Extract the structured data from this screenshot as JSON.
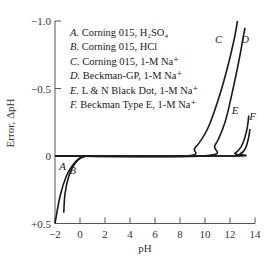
{
  "chart_data": {
    "type": "line",
    "title": "",
    "xlabel": "pH",
    "ylabel": "Error, ΔpH",
    "xlim": [
      -2,
      14
    ],
    "ylim": [
      0.5,
      -1.0
    ],
    "y_inverted": true,
    "grid": false,
    "x_ticks": [
      "-2",
      "0",
      "2",
      "4",
      "6",
      "8",
      "10",
      "12",
      "14"
    ],
    "y_ticks": [
      {
        "value": -1.0,
        "label": "−1.0"
      },
      {
        "value": -0.5,
        "label": "−0.5"
      },
      {
        "value": 0,
        "label": "0"
      },
      {
        "value": 0.5,
        "label": "+0.5"
      }
    ],
    "legend_position": "upper-left",
    "series": [
      {
        "key": "A",
        "name": "Corning 015, H₂SO₄",
        "x": [
          -2.0,
          -1.6,
          -1.1,
          -0.6,
          -0.1,
          0.3,
          0.6,
          1.0
        ],
        "y": [
          0.5,
          0.3,
          0.15,
          0.07,
          0.02,
          0.005,
          0.0,
          0.0
        ]
      },
      {
        "key": "B",
        "name": "Corning 015, HCl",
        "x": [
          -1.3,
          -1.2,
          -0.9,
          -0.5,
          -0.1,
          0.3,
          0.6,
          1.0
        ],
        "y": [
          0.42,
          0.28,
          0.15,
          0.07,
          0.025,
          0.005,
          0.0,
          0.0
        ]
      },
      {
        "key": "C",
        "name": "Corning 015, 1-M Na⁺",
        "x": [
          -2.0,
          8.2,
          9.2,
          10.2,
          11.0,
          11.7,
          12.3,
          12.6
        ],
        "y": [
          0.0,
          0.0,
          -0.06,
          -0.2,
          -0.4,
          -0.62,
          -0.85,
          -1.0
        ]
      },
      {
        "key": "D",
        "name": "Beckman-GP, 1-M Na⁺",
        "x": [
          -2.0,
          9.8,
          10.8,
          11.6,
          12.2,
          12.7,
          13.0,
          13.2
        ],
        "y": [
          0.0,
          0.0,
          -0.08,
          -0.25,
          -0.48,
          -0.7,
          -0.85,
          -0.95
        ]
      },
      {
        "key": "E",
        "name": "L & N Black Dot, 1-M Na⁺",
        "x": [
          -2.0,
          11.6,
          12.4,
          12.9,
          13.2,
          13.4,
          13.5
        ],
        "y": [
          0.0,
          0.0,
          -0.02,
          -0.07,
          -0.14,
          -0.22,
          -0.3
        ]
      },
      {
        "key": "F",
        "name": "Beckman Type E, 1-M Na⁺",
        "x": [
          -2.0,
          12.0,
          12.8,
          13.2,
          13.45,
          13.6
        ],
        "y": [
          0.0,
          0.0,
          -0.015,
          -0.05,
          -0.12,
          -0.2
        ]
      }
    ],
    "curve_labels": [
      {
        "key": "A",
        "x": -1.4,
        "y": 0.1
      },
      {
        "key": "B",
        "x": -0.6,
        "y": 0.13
      },
      {
        "key": "C",
        "x": 11.1,
        "y": -0.84
      },
      {
        "key": "D",
        "x": 13.2,
        "y": -0.84
      },
      {
        "key": "E",
        "x": 12.4,
        "y": -0.31
      },
      {
        "key": "F",
        "x": 13.8,
        "y": -0.27
      }
    ]
  },
  "legend": [
    {
      "key": "A.",
      "text": "Corning 015, H₂SO₄"
    },
    {
      "key": "B.",
      "text": "Corning 015, HCl"
    },
    {
      "key": "C.",
      "text": "Corning 015, 1-M Na⁺"
    },
    {
      "key": "D.",
      "text": "Beckman-GP, 1-M Na⁺"
    },
    {
      "key": "E.",
      "text": "L & N Black Dot, 1-M Na⁺"
    },
    {
      "key": "F.",
      "text": "Beckman Type E, 1-M Na⁺"
    }
  ],
  "style": {
    "line_color": "#1a1a1a",
    "axis_color": "#555555"
  }
}
